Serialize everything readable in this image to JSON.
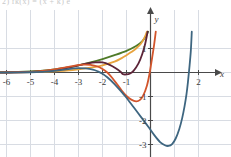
{
  "figure": {
    "background_color": "#ffffff",
    "grid_color": "#d8dce3",
    "axis_color": "#4a4a4a",
    "label_color": "#3b3b3b",
    "cropped_header_text": "2) fk(x) = (x + k) e",
    "axis_labels": {
      "x": "x",
      "y": "y"
    }
  },
  "chart_data": {
    "type": "line",
    "title": "",
    "xlabel": "x",
    "ylabel": "y",
    "xlim": [
      -6.4,
      2.6
    ],
    "ylim": [
      -3.6,
      1.8
    ],
    "xticks": [
      -6,
      -5,
      -4,
      -3,
      -2,
      -1,
      2
    ],
    "xtick_labels": [
      "-6",
      "-5",
      "-4",
      "-3",
      "-2",
      "-1",
      "2"
    ],
    "yticks": [
      1,
      -1,
      -2,
      -3
    ],
    "ytick_labels": [
      "1",
      "-1",
      "-2",
      "-3"
    ],
    "grid": true,
    "grid_step": 1,
    "legend": "none",
    "series": [
      {
        "name": "curve-1-green",
        "color": "#4f7a28",
        "minimum": {
          "x": -6.0,
          "y": 0.0
        },
        "points": [
          [
            -6.4,
            0.01
          ],
          [
            -6.0,
            0.02
          ],
          [
            -5.5,
            0.03
          ],
          [
            -5.0,
            0.05
          ],
          [
            -4.5,
            0.08
          ],
          [
            -4.0,
            0.13
          ],
          [
            -3.5,
            0.2
          ],
          [
            -3.0,
            0.3
          ],
          [
            -2.5,
            0.42
          ],
          [
            -2.0,
            0.56
          ],
          [
            -1.5,
            0.72
          ],
          [
            -1.0,
            0.9
          ],
          [
            -0.6,
            1.1
          ],
          [
            -0.35,
            1.3
          ],
          [
            -0.2,
            1.5
          ],
          [
            -0.1,
            1.7
          ]
        ]
      },
      {
        "name": "curve-2-amber",
        "color": "#e8a33d",
        "minimum": {
          "x": -4.0,
          "y": 0.0
        },
        "points": [
          [
            -6.4,
            0.0
          ],
          [
            -6.0,
            0.0
          ],
          [
            -5.5,
            0.01
          ],
          [
            -5.0,
            0.02
          ],
          [
            -4.5,
            0.03
          ],
          [
            -4.0,
            0.05
          ],
          [
            -3.5,
            0.08
          ],
          [
            -3.0,
            0.13
          ],
          [
            -2.5,
            0.2
          ],
          [
            -2.0,
            0.3
          ],
          [
            -1.5,
            0.45
          ],
          [
            -1.2,
            0.6
          ],
          [
            -1.0,
            0.72
          ],
          [
            -0.8,
            0.85
          ],
          [
            -0.6,
            1.0
          ],
          [
            -0.4,
            1.2
          ],
          [
            -0.25,
            1.45
          ],
          [
            -0.15,
            1.7
          ]
        ]
      },
      {
        "name": "curve-3-maroon",
        "color": "#5c2438",
        "minimum": {
          "x": -1.15,
          "y": -0.08
        },
        "points": [
          [
            -6.4,
            0.0
          ],
          [
            -6.0,
            0.0
          ],
          [
            -5.0,
            0.02
          ],
          [
            -4.5,
            0.05
          ],
          [
            -4.0,
            0.1
          ],
          [
            -3.5,
            0.18
          ],
          [
            -3.0,
            0.3
          ],
          [
            -2.6,
            0.38
          ],
          [
            -2.3,
            0.42
          ],
          [
            -2.0,
            0.42
          ],
          [
            -1.7,
            0.32
          ],
          [
            -1.45,
            0.18
          ],
          [
            -1.25,
            0.03
          ],
          [
            -1.15,
            -0.07
          ],
          [
            -1.0,
            -0.08
          ],
          [
            -0.85,
            -0.04
          ],
          [
            -0.7,
            0.08
          ],
          [
            -0.5,
            0.38
          ],
          [
            -0.35,
            0.75
          ],
          [
            -0.22,
            1.2
          ],
          [
            -0.12,
            1.7
          ]
        ]
      },
      {
        "name": "curve-4-orange-red",
        "color": "#d2552c",
        "minimum": {
          "x": -0.6,
          "y": -1.2
        },
        "points": [
          [
            -6.4,
            0.0
          ],
          [
            -6.0,
            0.01
          ],
          [
            -5.0,
            0.03
          ],
          [
            -4.5,
            0.07
          ],
          [
            -4.0,
            0.13
          ],
          [
            -3.5,
            0.22
          ],
          [
            -3.1,
            0.3
          ],
          [
            -2.8,
            0.33
          ],
          [
            -2.5,
            0.32
          ],
          [
            -2.2,
            0.25
          ],
          [
            -2.0,
            0.15
          ],
          [
            -1.8,
            0.0
          ],
          [
            -1.6,
            -0.22
          ],
          [
            -1.4,
            -0.48
          ],
          [
            -1.2,
            -0.75
          ],
          [
            -1.0,
            -0.98
          ],
          [
            -0.8,
            -1.13
          ],
          [
            -0.6,
            -1.2
          ],
          [
            -0.45,
            -1.15
          ],
          [
            -0.3,
            -0.95
          ],
          [
            -0.15,
            -0.55
          ],
          [
            -0.05,
            -0.1
          ],
          [
            0.05,
            0.5
          ],
          [
            0.15,
            1.15
          ],
          [
            0.22,
            1.7
          ]
        ]
      },
      {
        "name": "curve-5-steel-blue",
        "color": "#3e6680",
        "minimum": {
          "x": 0.72,
          "y": -3.05
        },
        "points": [
          [
            -6.4,
            0.0
          ],
          [
            -6.0,
            0.0
          ],
          [
            -5.0,
            0.01
          ],
          [
            -4.5,
            0.03
          ],
          [
            -4.0,
            0.07
          ],
          [
            -3.5,
            0.13
          ],
          [
            -3.2,
            0.17
          ],
          [
            -3.0,
            0.18
          ],
          [
            -2.7,
            0.17
          ],
          [
            -2.4,
            0.12
          ],
          [
            -2.2,
            0.05
          ],
          [
            -2.0,
            -0.05
          ],
          [
            -1.8,
            -0.2
          ],
          [
            -1.5,
            -0.48
          ],
          [
            -1.2,
            -0.82
          ],
          [
            -1.0,
            -1.05
          ],
          [
            -0.7,
            -1.45
          ],
          [
            -0.4,
            -1.85
          ],
          [
            -0.1,
            -2.25
          ],
          [
            0.15,
            -2.6
          ],
          [
            0.4,
            -2.9
          ],
          [
            0.6,
            -3.03
          ],
          [
            0.75,
            -3.06
          ],
          [
            0.9,
            -2.98
          ],
          [
            1.05,
            -2.75
          ],
          [
            1.2,
            -2.35
          ],
          [
            1.32,
            -1.9
          ],
          [
            1.42,
            -1.4
          ],
          [
            1.5,
            -0.9
          ],
          [
            1.56,
            -0.4
          ],
          [
            1.62,
            0.2
          ],
          [
            1.68,
            0.9
          ],
          [
            1.72,
            1.7
          ]
        ]
      }
    ]
  }
}
